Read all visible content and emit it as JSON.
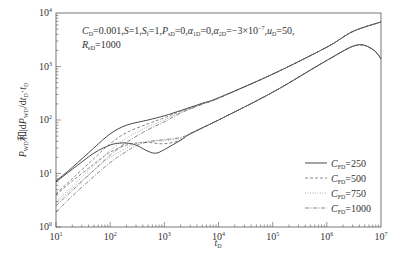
{
  "chart_data": {
    "type": "line",
    "title": "",
    "xlabel": "t_D",
    "ylabel": "P_WD和|dP_WD/dt_D·t_D",
    "xscale": "log",
    "yscale": "log",
    "xlim": [
      10,
      10000000
    ],
    "ylim": [
      1,
      10000
    ],
    "x_ticks": [
      {
        "value": 10,
        "base": "10",
        "exp": "1"
      },
      {
        "value": 100,
        "base": "10",
        "exp": "2"
      },
      {
        "value": 1000,
        "base": "10",
        "exp": "3"
      },
      {
        "value": 10000,
        "base": "10",
        "exp": "4"
      },
      {
        "value": 100000,
        "base": "10",
        "exp": "5"
      },
      {
        "value": 1000000,
        "base": "10",
        "exp": "6"
      },
      {
        "value": 10000000,
        "base": "10",
        "exp": "7"
      }
    ],
    "y_ticks": [
      {
        "value": 1,
        "base": "10",
        "exp": "0"
      },
      {
        "value": 10,
        "base": "10",
        "exp": "1"
      },
      {
        "value": 100,
        "base": "10",
        "exp": "2"
      },
      {
        "value": 1000,
        "base": "10",
        "exp": "3"
      },
      {
        "value": 10000,
        "base": "10",
        "exp": "4"
      }
    ],
    "grid": false,
    "legend_position": "lower-right",
    "annotation": {
      "line1": "C_D=0.001, S=1, S_f=1, P_sD=0, α_1D=0, α_2D=−3×10^−7, u_D=50,",
      "line2": "R_eD=1000"
    },
    "series": [
      {
        "name": "C_FD=250",
        "style": "solid",
        "kind": "pressure",
        "x": [
          10,
          20,
          50,
          100,
          200,
          500,
          1000,
          2000,
          5000,
          10000,
          100000,
          1000000,
          3000000,
          10000000
        ],
        "y": [
          7.2,
          13,
          30,
          55,
          80,
          100,
          120,
          150,
          205,
          260,
          720,
          2300,
          4500,
          6800
        ]
      },
      {
        "name": "C_FD=500",
        "style": "dashed",
        "kind": "pressure",
        "x": [
          10,
          20,
          50,
          100,
          200,
          500,
          1000,
          2000,
          5000,
          10000,
          100000,
          1000000,
          3000000,
          10000000
        ],
        "y": [
          4.2,
          8,
          19,
          36,
          58,
          85,
          110,
          145,
          200,
          258,
          720,
          2300,
          4500,
          6800
        ]
      },
      {
        "name": "C_FD=750",
        "style": "dotted",
        "kind": "pressure",
        "x": [
          10,
          20,
          50,
          100,
          200,
          500,
          1000,
          2000,
          5000,
          10000,
          100000,
          1000000,
          3000000,
          10000000
        ],
        "y": [
          3.0,
          5.8,
          14,
          27,
          46,
          75,
          100,
          140,
          198,
          256,
          720,
          2300,
          4500,
          6800
        ]
      },
      {
        "name": "C_FD=1000",
        "style": "dashdot",
        "kind": "pressure",
        "x": [
          10,
          20,
          50,
          100,
          200,
          500,
          1000,
          2000,
          5000,
          10000,
          100000,
          1000000,
          3000000,
          10000000
        ],
        "y": [
          2.5,
          4.8,
          11.5,
          22,
          38,
          66,
          92,
          135,
          196,
          255,
          720,
          2300,
          4500,
          6800
        ]
      },
      {
        "name": "C_FD=250",
        "style": "solid",
        "kind": "derivative",
        "x": [
          10,
          20,
          50,
          100,
          150,
          200,
          300,
          500,
          700,
          1000,
          2000,
          3000,
          10000,
          100000,
          1000000,
          3500000,
          7000000,
          10000000
        ],
        "y": [
          7.0,
          12,
          24,
          34,
          37,
          37,
          34,
          26,
          24,
          28,
          42,
          55,
          100,
          330,
          1300,
          2500,
          2100,
          1400
        ]
      },
      {
        "name": "C_FD=500",
        "style": "dashed",
        "kind": "derivative",
        "x": [
          10,
          20,
          50,
          100,
          200,
          300,
          500,
          1000,
          2000,
          3000,
          10000,
          100000,
          1000000,
          3500000,
          7000000,
          10000000
        ],
        "y": [
          4.0,
          7.2,
          15,
          25,
          34,
          37,
          38,
          36,
          42,
          55,
          100,
          330,
          1300,
          2500,
          2100,
          1400
        ]
      },
      {
        "name": "C_FD=750",
        "style": "dotted",
        "kind": "derivative",
        "x": [
          10,
          20,
          50,
          100,
          200,
          300,
          500,
          1000,
          2000,
          3000,
          10000,
          100000,
          1000000,
          3500000,
          7000000,
          10000000
        ],
        "y": [
          2.8,
          5.2,
          11.5,
          20,
          30,
          36,
          40,
          41,
          45,
          55,
          100,
          330,
          1300,
          2500,
          2100,
          1400
        ]
      },
      {
        "name": "C_FD=1000",
        "style": "dashdot",
        "kind": "derivative",
        "x": [
          10,
          20,
          50,
          100,
          200,
          300,
          500,
          1000,
          2000,
          3000,
          10000,
          100000,
          1000000,
          3500000,
          7000000,
          10000000
        ],
        "y": [
          1.9,
          3.8,
          8.8,
          16,
          26,
          33,
          39,
          43,
          47,
          56,
          100,
          330,
          1300,
          2500,
          2100,
          1400
        ]
      }
    ],
    "legend": [
      {
        "label_base": "C",
        "label_sub": "FD",
        "label_value": "=250",
        "style": "solid"
      },
      {
        "label_base": "C",
        "label_sub": "FD",
        "label_value": "=500",
        "style": "dashed"
      },
      {
        "label_base": "C",
        "label_sub": "FD",
        "label_value": "=750",
        "style": "dotted"
      },
      {
        "label_base": "C",
        "label_sub": "FD",
        "label_value": "=1000",
        "style": "dashdot"
      }
    ]
  }
}
